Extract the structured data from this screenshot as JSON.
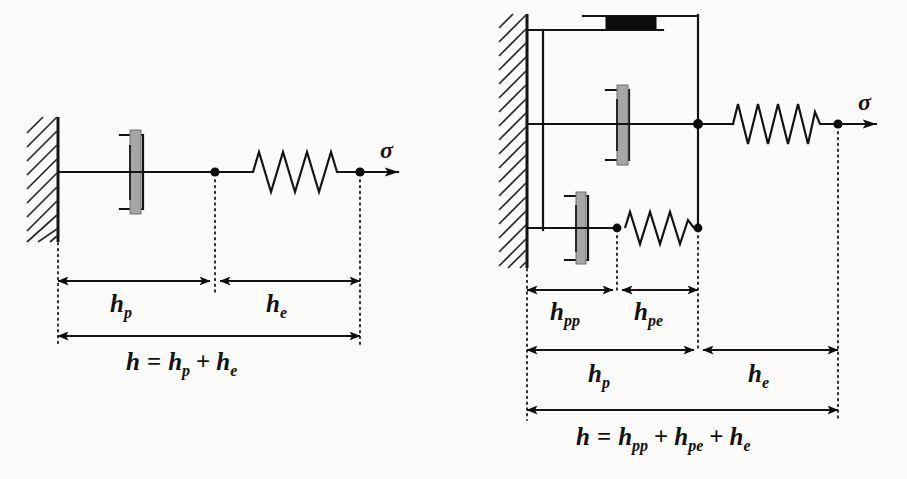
{
  "figure": {
    "background_color": "#fbfbfa",
    "ink_color": "#141414",
    "piston_fill": "#a6a6a6",
    "slider_fill": "#0d0d0d"
  },
  "diagrams": [
    {
      "id": "left-model",
      "name": "elastic-plastic-series-model",
      "stress_label": "σ",
      "elements": [
        {
          "name": "fixed-wall",
          "type": "wall"
        },
        {
          "name": "dashpot",
          "type": "dashpot"
        },
        {
          "name": "spring",
          "type": "spring",
          "coils": 6
        }
      ],
      "dimensions": [
        {
          "name": "h-p",
          "base": "h",
          "sub": "p",
          "label": "h_p"
        },
        {
          "name": "h-e",
          "base": "h",
          "sub": "e",
          "label": "h_e"
        }
      ],
      "equation": {
        "label": "h = h_p + h_e",
        "lhs": "h",
        "terms": [
          {
            "base": "h",
            "sub": "p"
          },
          {
            "base": "h",
            "sub": "e"
          }
        ],
        "operators": [
          "=",
          "+"
        ]
      }
    },
    {
      "id": "right-model",
      "name": "parallel-slider-dashpot-spring-model",
      "stress_label": "σ",
      "elements": [
        {
          "name": "fixed-wall",
          "type": "wall"
        },
        {
          "name": "friction-slider",
          "type": "slider"
        },
        {
          "name": "dashpot-middle",
          "type": "dashpot"
        },
        {
          "name": "dashpot-lower",
          "type": "dashpot"
        },
        {
          "name": "spring-lower",
          "type": "spring",
          "coils": 5
        },
        {
          "name": "spring-right",
          "type": "spring",
          "coils": 7
        }
      ],
      "dimensions": [
        {
          "name": "h-pp",
          "base": "h",
          "sub": "pp",
          "label": "h_pp"
        },
        {
          "name": "h-pe",
          "base": "h",
          "sub": "pe",
          "label": "h_pe"
        },
        {
          "name": "h-p",
          "base": "h",
          "sub": "p",
          "label": "h_p"
        },
        {
          "name": "h-e",
          "base": "h",
          "sub": "e",
          "label": "h_e"
        }
      ],
      "equation": {
        "label": "h = h_pp + h_pe + h_e",
        "lhs": "h",
        "terms": [
          {
            "base": "h",
            "sub": "pp"
          },
          {
            "base": "h",
            "sub": "pe"
          },
          {
            "base": "h",
            "sub": "e"
          }
        ],
        "operators": [
          "=",
          "+",
          "+"
        ]
      }
    }
  ],
  "glyphs": {
    "h": "h",
    "equals": "=",
    "plus": "+",
    "sigma": "σ",
    "sub_p": "p",
    "sub_e": "e",
    "sub_pp": "pp",
    "sub_pe": "pe"
  }
}
